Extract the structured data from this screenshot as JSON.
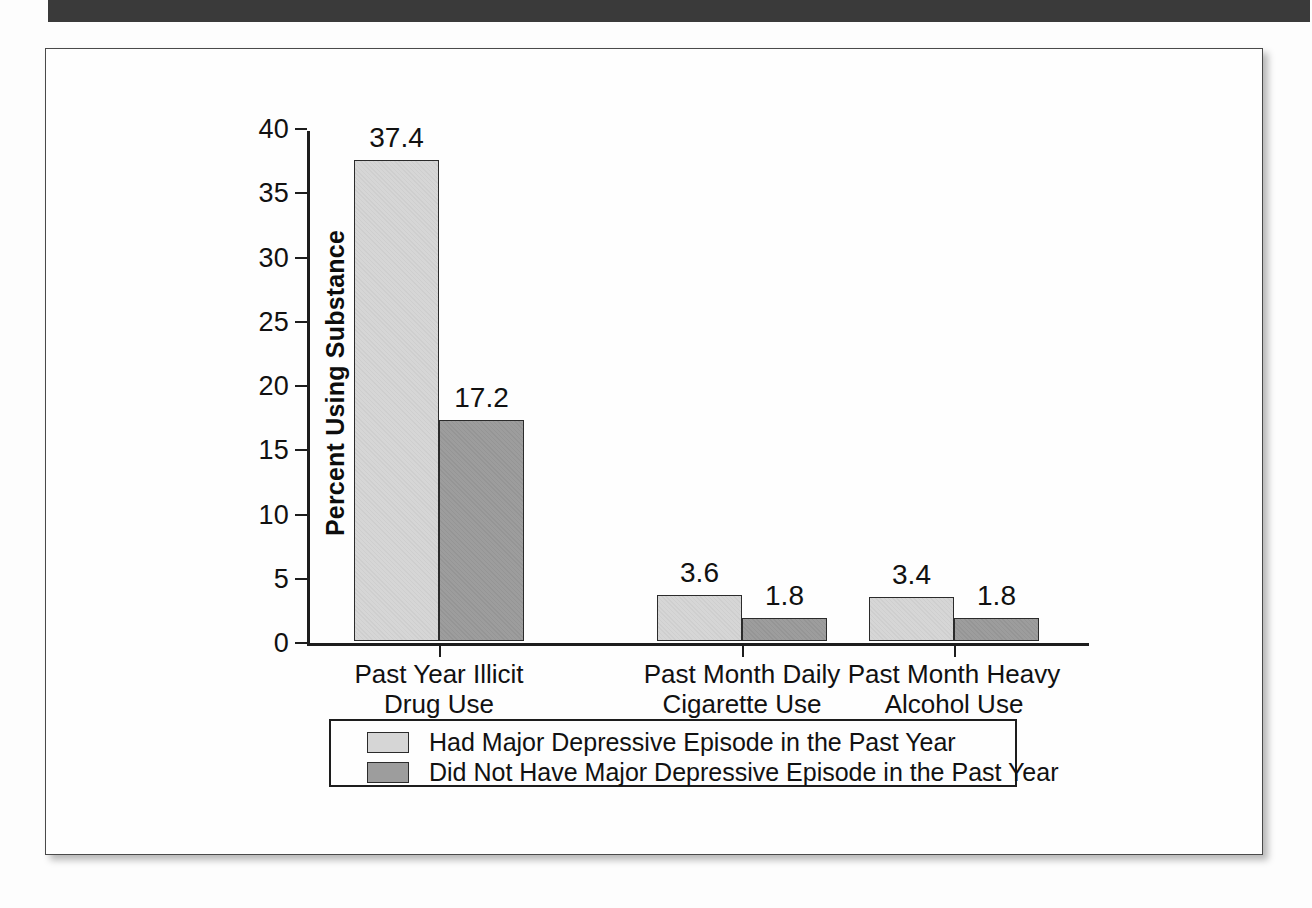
{
  "scan": {
    "header_bar_name": "scan-header-bar"
  },
  "chart_data": {
    "type": "bar",
    "title": "",
    "xlabel": "",
    "ylabel": "Percent Using Substance",
    "ylim": [
      0,
      40
    ],
    "yticks": [
      "0",
      "5",
      "10",
      "15",
      "20",
      "25",
      "30",
      "35",
      "40"
    ],
    "grid": false,
    "legend_position": "bottom",
    "categories": [
      "Past Year Illicit\nDrug Use",
      "Past Month Daily\nCigarette Use",
      "Past Month Heavy\nAlcohol Use"
    ],
    "categories_lines": [
      [
        "Past Year Illicit",
        "Drug Use"
      ],
      [
        "Past Month Daily",
        "Cigarette Use"
      ],
      [
        "Past Month Heavy",
        "Alcohol Use"
      ]
    ],
    "series": [
      {
        "name": "Had Major Depressive Episode in the Past Year",
        "color": "#d6d6d6",
        "values": [
          37.4,
          3.6,
          3.4
        ],
        "labels": [
          "37.4",
          "3.6",
          "3.4"
        ]
      },
      {
        "name": "Did Not Have Major Depressive Episode in the Past Year",
        "color": "#9d9d9d",
        "values": [
          17.2,
          1.8,
          1.8
        ],
        "labels": [
          "17.2",
          "1.8",
          "1.8"
        ]
      }
    ]
  }
}
